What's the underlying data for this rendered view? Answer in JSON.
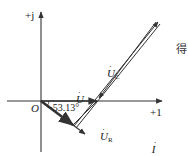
{
  "diagram": {
    "axes": {
      "imag_label": "+j",
      "real_label": "+1",
      "origin_label": "O"
    },
    "angle": {
      "label": "−53.13°",
      "value_deg": -53.13
    },
    "phasors": {
      "U": {
        "symbol": "U",
        "dot": "·",
        "sub": ""
      },
      "UC": {
        "symbol": "U",
        "dot": "·",
        "sub": "C"
      },
      "UL": {
        "symbol": "U",
        "dot": "·",
        "sub": "L"
      },
      "UR": {
        "symbol": "U",
        "dot": "·",
        "sub": "R"
      },
      "I": {
        "symbol": "I",
        "dot": "·",
        "sub": ""
      }
    },
    "trailing_text": "得",
    "colors": {
      "line": "#333333",
      "background": "#ffffff"
    }
  }
}
